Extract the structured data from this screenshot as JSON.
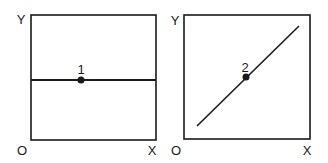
{
  "panels": [
    {
      "y_label": "Y",
      "origin_label": "O",
      "x_label": "X",
      "point_label": "1",
      "line": "horizontal"
    },
    {
      "y_label": "Y",
      "origin_label": "O",
      "x_label": "X",
      "point_label": "2",
      "line": "diagonal"
    }
  ],
  "colors": {
    "stroke": "#1a1a1a",
    "background": "#ffffff"
  }
}
